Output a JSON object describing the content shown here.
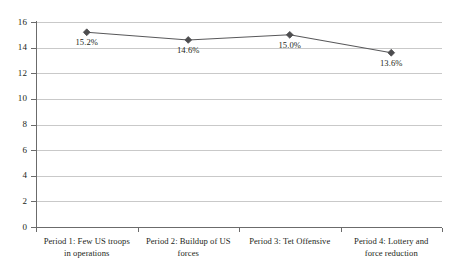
{
  "chart_data": {
    "type": "line",
    "title": "",
    "subtitle": "",
    "xlabel": "",
    "ylabel": "",
    "ylim": [
      0,
      16
    ],
    "grid": true,
    "legend": false,
    "legend_position": "none",
    "categories": [
      "Period 1: Few US troops in operations",
      "Period 2: Buildup of US forces",
      "Period 3: Tet Offensive",
      "Period 4: Lottery and force reduction"
    ],
    "category_lines": [
      [
        "Period 1: Few US troops",
        "in operations"
      ],
      [
        "Period 2: Buildup of US",
        "forces"
      ],
      [
        "Period 3: Tet Offensive"
      ],
      [
        "Period 4: Lottery and",
        "force reduction"
      ]
    ],
    "values": [
      15.2,
      14.6,
      15.0,
      13.6
    ],
    "point_labels": [
      "15.2%",
      "14.6%",
      "15.0%",
      "13.6%"
    ],
    "yticks": [
      16,
      14,
      12,
      10,
      8,
      6,
      4,
      2,
      0
    ],
    "ytick_labels": [
      "16",
      "14",
      "12",
      "10",
      "8",
      "6",
      "4",
      "2",
      "0"
    ],
    "series": [
      {
        "name": "",
        "values": [
          15.2,
          14.6,
          15.0,
          13.6
        ],
        "marker": "diamond"
      }
    ],
    "colors": {
      "line": "#58585a",
      "marker": "#4d4d4f",
      "gridline": "#c9c9c9",
      "axis": "#6b6b6b",
      "text": "#231f20",
      "background": "#ffffff"
    }
  }
}
